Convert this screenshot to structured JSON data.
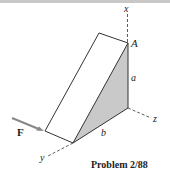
{
  "figure": {
    "caption": "Problem 2/88",
    "labels": {
      "x_axis": "x",
      "y_axis": "y",
      "z_axis": "z",
      "point_A": "A",
      "dim_a": "a",
      "dim_b": "b",
      "force": "F"
    },
    "colors": {
      "line": "#333333",
      "shaded_face": "#c9c9c9",
      "force_arrow": "#888888",
      "top_band": "#c8c8c8"
    }
  }
}
